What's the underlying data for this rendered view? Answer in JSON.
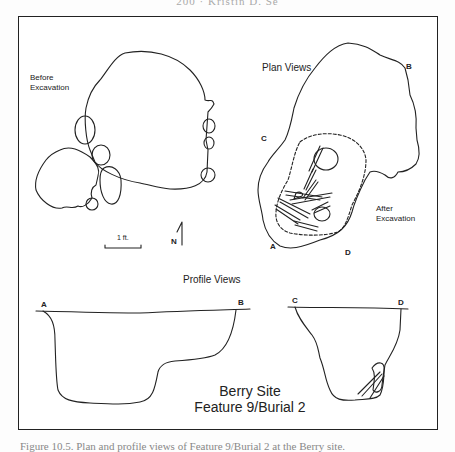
{
  "running_head": "200 · Kristin D. Se",
  "figure": {
    "plan_views_title": "Plan Views",
    "profile_views_title": "Profile Views",
    "before_label_line1": "Before",
    "before_label_line2": "Excavation",
    "after_label_line1": "After",
    "after_label_line2": "Excavation",
    "scale_label": "1 ft.",
    "north_label": "N",
    "site_title_line1": "Berry Site",
    "site_title_line2": "Feature 9/Burial 2",
    "points": {
      "a": "A",
      "b": "B",
      "c": "C",
      "d": "D"
    }
  },
  "caption": "Figure 10.5. Plan and profile views of Feature 9/Burial 2 at the Berry site."
}
